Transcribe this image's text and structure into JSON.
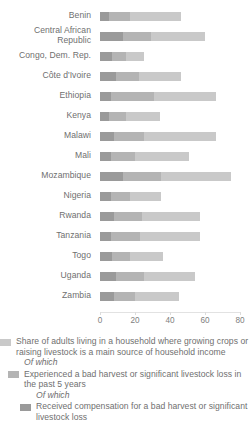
{
  "chart_data": {
    "type": "bar",
    "orientation": "horizontal",
    "stacked": true,
    "title": "",
    "xlabel": "",
    "ylabel": "",
    "xlim": [
      0,
      80
    ],
    "xticks": [
      0,
      20,
      40,
      60,
      80
    ],
    "xtick_labels": [
      "0",
      "20",
      "40",
      "60",
      "80"
    ],
    "grid": false,
    "legend_position": "bottom-left",
    "categories": [
      "Benin",
      "Central African\nRepublic",
      "Congo, Dem. Rep.",
      "Côte d'Ivoire",
      "Ethiopia",
      "Kenya",
      "Malawi",
      "Mali",
      "Mozambique",
      "Nigeria",
      "Rwanda",
      "Tanzania",
      "Togo",
      "Uganda",
      "Zambia"
    ],
    "series": [
      {
        "name": "Received compensation for a bad harvest or significant livestock loss",
        "color": "#9a9a9a",
        "values": [
          5,
          13,
          7,
          9,
          6,
          5,
          8,
          6,
          13,
          6,
          8,
          6,
          7,
          9,
          8
        ]
      },
      {
        "name": "Experienced a bad harvest or significant livestock loss in the past 5 years",
        "color": "#b4b4b4",
        "values": [
          12,
          16,
          8,
          13,
          25,
          10,
          17,
          14,
          22,
          11,
          16,
          17,
          10,
          16,
          12
        ]
      },
      {
        "name": "Share of adults living in a household where growing crops or raising livestock is a main source of household income",
        "color": "#c9c9c9",
        "values": [
          29,
          31,
          10,
          24,
          35,
          19,
          41,
          31,
          40,
          18,
          33,
          34,
          19,
          29,
          25
        ]
      }
    ],
    "totals": [
      46,
      60,
      25,
      46,
      66,
      34,
      66,
      51,
      75,
      35,
      57,
      57,
      36,
      54,
      45
    ]
  },
  "axis": {
    "ticks": [
      {
        "label": "0",
        "value": 0
      },
      {
        "label": "20",
        "value": 20
      },
      {
        "label": "40",
        "value": 40
      },
      {
        "label": "60",
        "value": 60
      },
      {
        "label": "80",
        "value": 80
      }
    ]
  },
  "legend": {
    "entries": [
      {
        "swatch_color": "#c9c9c9",
        "text": "Share of adults living in a household where growing crops or raising livestock is a main source of household income",
        "indent": 0
      },
      {
        "swatch_color": "#b4b4b4",
        "text": "Experienced a bad harvest or significant livestock loss in the past 5 years",
        "indent": 1
      },
      {
        "swatch_color": "#9a9a9a",
        "text": "Received compensation for a bad harvest or significant livestock loss",
        "indent": 2
      }
    ],
    "of_which_label_1": "Of which",
    "of_which_label_2": "Of which"
  }
}
